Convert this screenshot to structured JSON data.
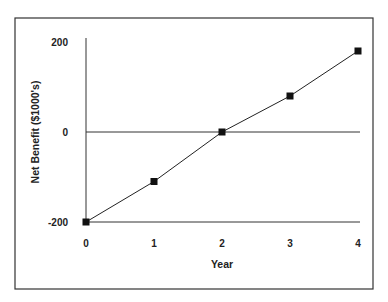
{
  "chart_data": {
    "type": "line",
    "title": "",
    "xlabel": "Year",
    "ylabel": "Net Benefit ($1000's)",
    "x": [
      0,
      1,
      2,
      3,
      4
    ],
    "x_tick_labels": [
      "0",
      "1",
      "2",
      "3",
      "4"
    ],
    "y_tick_labels": [
      "200",
      "0",
      "-200"
    ],
    "series": [
      {
        "name": "Net Benefit",
        "values": [
          -200,
          -110,
          0,
          80,
          180
        ]
      }
    ],
    "ylim": [
      -200,
      200
    ],
    "xlim": [
      0,
      4
    ],
    "grid": false,
    "legend": null,
    "reference_lines": [
      {
        "axis": "y",
        "value": 0
      },
      {
        "axis": "y",
        "value": -200
      }
    ],
    "marker": "square",
    "colors": {
      "line": "#222222",
      "marker": "#111111",
      "frame": "#333333"
    }
  }
}
